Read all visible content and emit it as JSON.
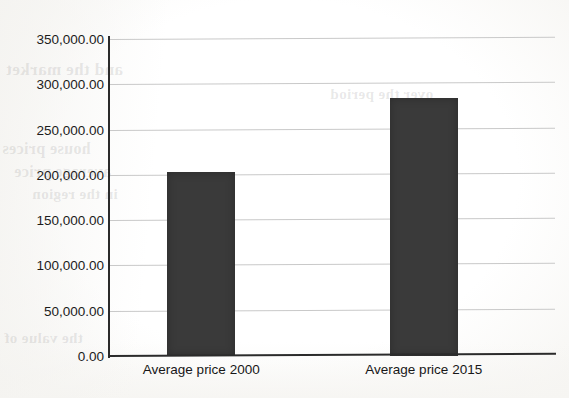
{
  "chart_data": {
    "type": "bar",
    "title": "",
    "subtitle": "",
    "xlabel": "",
    "ylabel": "",
    "categories": [
      "Average price 2000",
      "Average price 2015"
    ],
    "values": [
      203000,
      285000
    ],
    "series": [
      {
        "name": "Average price",
        "values": [
          203000,
          285000
        ]
      }
    ],
    "ylim": [
      0,
      350000
    ],
    "y_tick_values": [
      350000,
      300000,
      250000,
      200000,
      150000,
      100000,
      50000,
      0
    ],
    "y_tick_labels": [
      "350,000.00",
      "300,000.00",
      "250,000.00",
      "200,000.00",
      "150,000.00",
      "100,000.00",
      "50,000.00",
      "0.00"
    ],
    "grid": true,
    "grid_axis": "y",
    "legend": false,
    "legend_position": "none",
    "bar_color": "#3a3a3a",
    "gridline_color": "#c9c9c9",
    "axis_color": "#2b2b2b",
    "background_color": "#fdfdfb",
    "annotations": []
  },
  "background_artifacts": {
    "note": "faint show-through text from the reverse side of the scanned page",
    "fragments": [
      "and the market",
      "house prices",
      "average price",
      "in the region",
      "the value of",
      "over the period"
    ]
  }
}
